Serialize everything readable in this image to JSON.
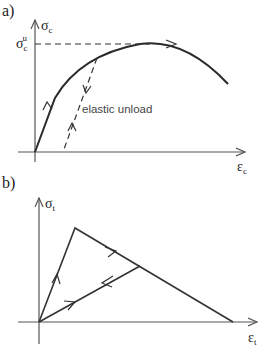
{
  "panels": {
    "a": {
      "label": "a)",
      "y_axis_symbol": "σ",
      "y_axis_subscript": "c",
      "x_axis_symbol": "ε",
      "x_axis_subscript": "c",
      "peak_label_symbol": "σ",
      "peak_label_subscript": "c",
      "peak_label_superscript": "u",
      "annotation": "elastic unload",
      "curve": "compressive stress-strain: loading curve rising to peak σcu, then softening; dashed elastic unload/reload line"
    },
    "b": {
      "label": "b)",
      "y_axis_symbol": "σ",
      "y_axis_subscript": "t",
      "x_axis_symbol": "ε",
      "x_axis_subscript": "t",
      "curve": "tensile bilinear: linear rise to peak, linear softening to zero; unloading line back to origin"
    }
  },
  "colors": {
    "line": "#2a2a2a",
    "axis": "#555555",
    "text": "#222222",
    "background": "#ffffff"
  }
}
